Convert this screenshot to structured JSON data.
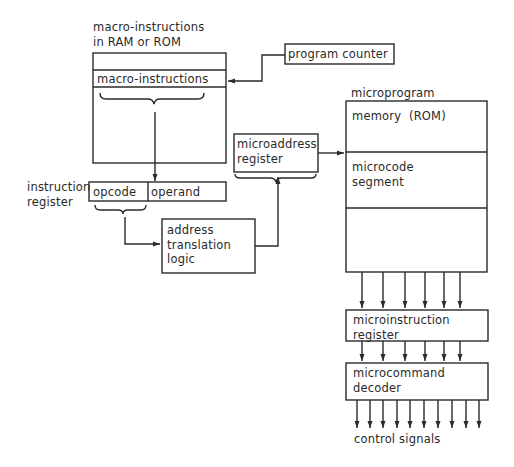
{
  "title_labels": {
    "macro_memory_caption_line1": "macro-instructions",
    "macro_memory_caption_line2": "in RAM or ROM",
    "microprogram_caption": "microprogram",
    "instruction_register_caption_line1": "instruction",
    "instruction_register_caption_line2": "register",
    "control_signals_caption": "control signals"
  },
  "blocks": {
    "macro_memory": {
      "row_label": "macro-instructions"
    },
    "program_counter": {
      "label": "program counter"
    },
    "instruction_register": {
      "opcode_label": "opcode",
      "operand_label": "operand"
    },
    "address_translation_logic": {
      "label": "address\ntranslation\nlogic"
    },
    "microaddress_register": {
      "label": "microaddress\nregister"
    },
    "microprogram_memory": {
      "segment1_label": "memory  (ROM)",
      "segment2_label": "microcode\nsegment"
    },
    "microinstruction_register": {
      "label": "microinstruction\nregister"
    },
    "microcommand_decoder": {
      "label": "microcommand\ndecoder"
    }
  },
  "connections": {
    "memory_to_microinstruction_lines": 6,
    "microinstruction_to_decoder_lines": 6,
    "control_signal_outputs": 10
  },
  "colors": {
    "stroke": "#2a2a2a",
    "background": "#ffffff"
  }
}
